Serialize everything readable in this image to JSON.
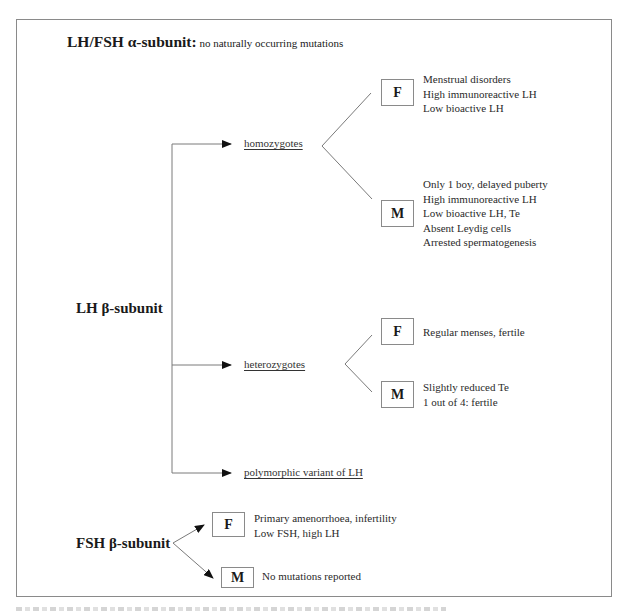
{
  "alpha_subunit": {
    "label": "LH/FSH α-subunit",
    "separator": ":",
    "note": " no naturally occurring mutations"
  },
  "lh_beta": {
    "label": "LH β-subunit",
    "branches": [
      {
        "label": "homozygotes",
        "groups": [
          {
            "sex": "F",
            "findings": [
              "Menstrual disorders",
              "High immunoreactive LH",
              "Low bioactive LH"
            ]
          },
          {
            "sex": "M",
            "findings": [
              "Only 1 boy, delayed puberty",
              "High immunoreactive LH",
              "Low bioactive LH, Te",
              "Absent Leydig cells",
              "Arrested spermatogenesis"
            ]
          }
        ]
      },
      {
        "label": "heterozygotes",
        "groups": [
          {
            "sex": "F",
            "findings": [
              "Regular menses, fertile"
            ]
          },
          {
            "sex": "M",
            "findings": [
              "Slightly reduced Te",
              "1 out of 4: fertile"
            ]
          }
        ]
      },
      {
        "label": "polymorphic variant of LH"
      }
    ]
  },
  "fsh_beta": {
    "label": "FSH β-subunit",
    "groups": [
      {
        "sex": "F",
        "findings": [
          "Primary amenorrhoea, infertility",
          "Low FSH, high LH"
        ]
      },
      {
        "sex": "M",
        "findings": [
          "No mutations reported"
        ]
      }
    ]
  },
  "colors": {
    "line": "#7a7a7a",
    "arrow": "#111111",
    "frame": "#8a8a8a",
    "text": "#1a1a1a"
  }
}
